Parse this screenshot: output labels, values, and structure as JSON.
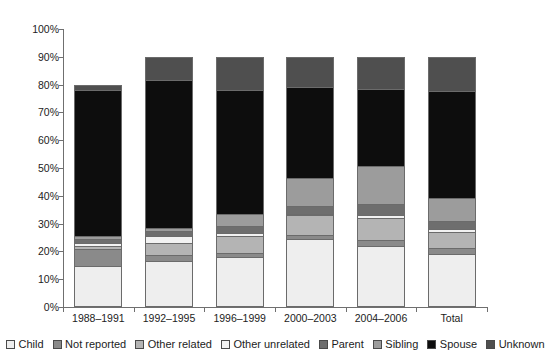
{
  "chart_data": {
    "type": "bar",
    "title": "",
    "subtitle": "",
    "xlabel": "",
    "ylabel": "",
    "stacked": true,
    "stack_mode": "percent",
    "grid": false,
    "legend_position": "bottom",
    "ylim": [
      0,
      100
    ],
    "yticks": [
      "0%",
      "10%",
      "20%",
      "30%",
      "40%",
      "50%",
      "60%",
      "70%",
      "80%",
      "90%",
      "100%"
    ],
    "ytick_values": [
      0,
      10,
      20,
      30,
      40,
      50,
      60,
      70,
      80,
      90,
      100
    ],
    "categories": [
      "1988–1991",
      "1992–1995",
      "1996–1999",
      "2000–2003",
      "2004–2006",
      "Total"
    ],
    "series": [
      {
        "name": "Child",
        "color": "#eeeeee",
        "values": [
          14.0,
          16.0,
          17.5,
          24.0,
          21.5,
          18.5
        ]
      },
      {
        "name": "Not reported",
        "color": "#8a8a8a",
        "values": [
          6.5,
          2.0,
          1.5,
          1.5,
          2.0,
          2.0
        ]
      },
      {
        "name": "Other related",
        "color": "#b4b4b4",
        "values": [
          1.0,
          4.5,
          6.0,
          7.0,
          8.0,
          6.0
        ]
      },
      {
        "name": "Other unrelated",
        "color": "#f2f2f2",
        "values": [
          1.0,
          2.5,
          1.0,
          0.5,
          1.0,
          1.0
        ]
      },
      {
        "name": "Parent",
        "color": "#6e6e6e",
        "values": [
          1.5,
          2.0,
          2.5,
          3.0,
          4.0,
          3.0
        ]
      },
      {
        "name": "Sibling",
        "color": "#9c9c9c",
        "values": [
          1.0,
          1.0,
          4.5,
          10.0,
          14.0,
          8.5
        ]
      },
      {
        "name": "Spouse",
        "color": "#0d0d0d",
        "values": [
          53.0,
          53.5,
          45.0,
          33.0,
          28.0,
          38.5
        ]
      },
      {
        "name": "Unknown",
        "color": "#4f4f4f",
        "values": [
          2.0,
          8.5,
          12.0,
          11.0,
          11.5,
          12.5
        ]
      }
    ]
  },
  "legend": {
    "items": [
      {
        "label": "Child"
      },
      {
        "label": "Not reported"
      },
      {
        "label": "Other related"
      },
      {
        "label": "Other unrelated"
      },
      {
        "label": "Parent"
      },
      {
        "label": "Sibling"
      },
      {
        "label": "Spouse"
      },
      {
        "label": "Unknown"
      }
    ]
  }
}
